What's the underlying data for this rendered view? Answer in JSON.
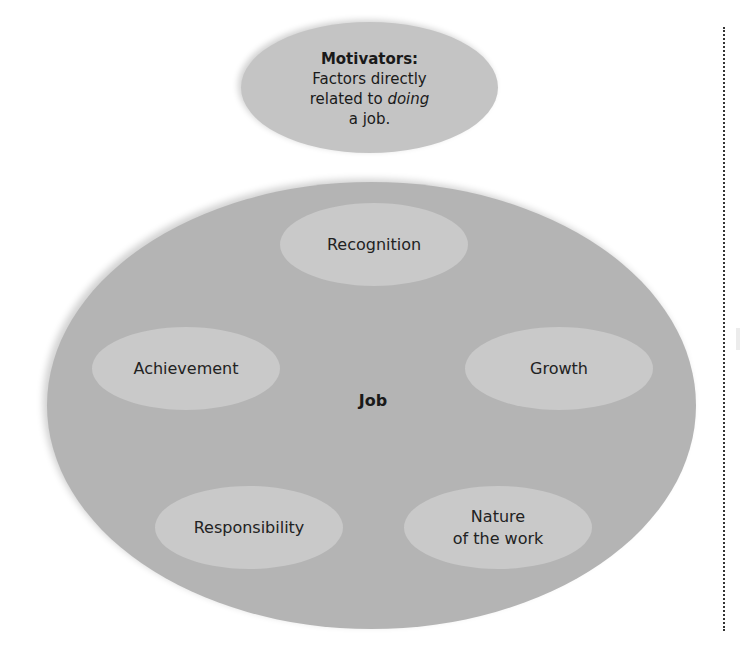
{
  "diagram": {
    "motivators": {
      "title": "Motivators:",
      "desc_line1": "Factors directly",
      "desc_line2_prefix": "related to ",
      "desc_line2_emph": "doing",
      "desc_line3": "a job."
    },
    "job": {
      "label": "Job",
      "factors": [
        {
          "label": "Recognition"
        },
        {
          "label": "Achievement"
        },
        {
          "label": "Growth"
        },
        {
          "label": "Responsibility"
        },
        {
          "label_line1": "Nature",
          "label_line2": "of the work"
        }
      ]
    },
    "colors": {
      "motivator_fill": "#c4c4c4",
      "job_fill": "#b4b4b4",
      "factor_fill": "#c9c9c9",
      "divider": "#333333"
    }
  }
}
